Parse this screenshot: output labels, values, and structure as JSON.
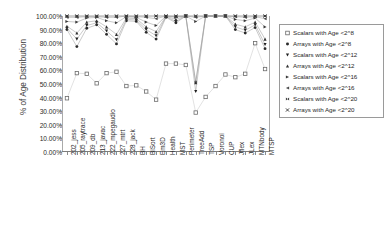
{
  "chart_data": {
    "type": "line",
    "title": "",
    "xlabel": "",
    "ylabel": "% of Age Distribution",
    "ylim": [
      0,
      100
    ],
    "ytick_labels": [
      "100.00%",
      "90.00%",
      "80.00%",
      "70.00%",
      "60.00%",
      "50.00%",
      "40.00%",
      "30.00%",
      "20.00%",
      "10.00%",
      "0.00%"
    ],
    "ytick_values": [
      100,
      90,
      80,
      70,
      60,
      50,
      40,
      30,
      20,
      10,
      0
    ],
    "grid": false,
    "legend_position": "right",
    "categories": [
      "202_jess",
      "205_raytrace",
      "209_db",
      "213_javac",
      "222_mpegaudio",
      "227_mtrt",
      "228_jack",
      "BH",
      "BiSort",
      "Em3D",
      "Health",
      "MST",
      "Perimeter",
      "TreeAdd",
      "TSP",
      "Voronoi",
      "CUP",
      "Jflex",
      "JLex",
      "MTNbody",
      "MTSP"
    ],
    "series": [
      {
        "name": "Scalars with Age <2^8",
        "marker": "open-square",
        "color": "#6b6b6b",
        "values": [
          39.5,
          58.0,
          57.5,
          50.5,
          58.0,
          59.0,
          48.5,
          49.0,
          44.5,
          38.5,
          65.0,
          65.0,
          64.0,
          29.0,
          40.5,
          48.5,
          57.0,
          55.0,
          57.5,
          80.0,
          61.0
        ]
      },
      {
        "name": "Arrays with Age <2^8",
        "marker": "filled-circle",
        "color": "#2a2a2a",
        "values": [
          90.0,
          77.5,
          91.0,
          93.5,
          86.5,
          79.5,
          96.5,
          96.0,
          88.0,
          83.0,
          99.0,
          95.0,
          100.0,
          51.5,
          100.0,
          100.0,
          100.0,
          90.0,
          87.5,
          91.5,
          76.0
        ]
      },
      {
        "name": "Scalars with Age <2^12",
        "marker": "down-triangle",
        "color": "#1f1f1f",
        "values": [
          91.0,
          83.0,
          93.0,
          95.0,
          89.0,
          82.5,
          97.5,
          97.0,
          90.0,
          85.5,
          99.5,
          96.0,
          100.0,
          44.5,
          100.0,
          100.0,
          100.0,
          92.0,
          89.5,
          93.5,
          79.0
        ]
      },
      {
        "name": "Arrays with Age <2^12",
        "marker": "up-triangle",
        "color": "#303030",
        "values": [
          92.5,
          87.5,
          95.5,
          96.5,
          92.0,
          86.5,
          98.5,
          98.0,
          92.0,
          88.5,
          99.8,
          97.5,
          100.0,
          51.0,
          100.0,
          100.0,
          100.0,
          94.0,
          92.0,
          95.5,
          83.0
        ]
      },
      {
        "name": "Scalars with Age <2^16",
        "marker": "right-triangle",
        "color": "#3a3a3a",
        "values": [
          96.0,
          95.5,
          98.5,
          99.0,
          96.5,
          95.0,
          99.5,
          99.0,
          95.5,
          93.0,
          100.0,
          99.0,
          100.0,
          96.0,
          100.0,
          100.0,
          100.0,
          97.5,
          96.5,
          98.5,
          92.0
        ]
      },
      {
        "name": "Arrays with Age <2^16",
        "marker": "left-triangle",
        "color": "#4a4a4a",
        "values": [
          99.0,
          99.0,
          99.5,
          99.5,
          99.0,
          99.0,
          100.0,
          99.5,
          99.0,
          98.0,
          100.0,
          99.5,
          100.0,
          99.0,
          100.0,
          100.0,
          100.0,
          99.5,
          99.0,
          99.5,
          98.0
        ]
      },
      {
        "name": "Scalars with Age <2^20",
        "marker": "bowtie",
        "color": "#2f2f2f",
        "values": [
          100.0,
          100.0,
          100.0,
          100.0,
          100.0,
          100.0,
          100.0,
          100.0,
          100.0,
          100.0,
          100.0,
          100.0,
          100.0,
          100.0,
          100.0,
          100.0,
          100.0,
          100.0,
          100.0,
          100.0,
          100.0
        ]
      },
      {
        "name": "Arrays with Age <2^20",
        "marker": "x-cross",
        "color": "#2f2f2f",
        "values": [
          100.0,
          100.0,
          100.0,
          100.0,
          100.0,
          100.0,
          100.0,
          100.0,
          100.0,
          100.0,
          100.0,
          100.0,
          100.0,
          100.0,
          100.0,
          100.0,
          100.0,
          100.0,
          100.0,
          100.0,
          100.0
        ]
      }
    ]
  },
  "legend": {
    "entries": [
      {
        "label": "Scalars with Age <2^8",
        "marker": "open-square"
      },
      {
        "label": "Arrays with Age <2^8",
        "marker": "filled-circle"
      },
      {
        "label": "Scalars with Age <2^12",
        "marker": "down-triangle"
      },
      {
        "label": "Arrays with Age <2^12",
        "marker": "up-triangle"
      },
      {
        "label": "Scalars with Age <2^16",
        "marker": "right-triangle"
      },
      {
        "label": "Arrays with Age <2^16",
        "marker": "left-triangle"
      },
      {
        "label": "Scalars with Age <2^20",
        "marker": "bowtie"
      },
      {
        "label": "Arrays with Age <2^20",
        "marker": "x-cross"
      }
    ]
  }
}
